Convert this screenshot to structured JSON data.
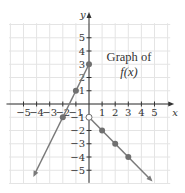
{
  "chart_data": {
    "type": "line",
    "title": "Graph of f(x)",
    "title_lines": [
      "Graph of",
      "f(x)"
    ],
    "xlabel": "x",
    "ylabel": "y",
    "xlim": [
      -5.8,
      6.2
    ],
    "ylim": [
      -6,
      6.8
    ],
    "x_ticks": [
      -5,
      -4,
      -3,
      -2,
      -1,
      1,
      2,
      3,
      4,
      5
    ],
    "x_tick_labels": [
      "−5",
      "−4",
      "−3",
      "−2",
      "−1",
      "1",
      "2",
      "3",
      "4",
      "5"
    ],
    "y_ticks": [
      5,
      4,
      3,
      2,
      1,
      -1,
      -2,
      -3,
      -4,
      -5
    ],
    "y_tick_labels": [
      "5",
      "4",
      "3",
      "2",
      "1",
      "−1",
      "−2",
      "−3",
      "−4",
      "−5"
    ],
    "grid": true,
    "legend": null,
    "series": [
      {
        "name": "f(x) for x ≤ 0",
        "equation": "y = 2x + 3",
        "segment": [
          [
            0,
            3
          ],
          [
            -4.25,
            -5.5
          ]
        ],
        "arrow_end": [
          -4.25,
          -5.5
        ],
        "points": [
          {
            "x": 0,
            "y": 3,
            "filled": true
          },
          {
            "x": -1,
            "y": 1,
            "filled": true
          },
          {
            "x": -2,
            "y": -1,
            "filled": true
          }
        ]
      },
      {
        "name": "f(x) for x > 0",
        "equation": "y = -x - 1",
        "segment": [
          [
            0,
            -1
          ],
          [
            4.85,
            -5.85
          ]
        ],
        "arrow_end": [
          4.85,
          -5.85
        ],
        "points": [
          {
            "x": 0,
            "y": -1,
            "filled": false
          },
          {
            "x": 1,
            "y": -2,
            "filled": true
          },
          {
            "x": 2,
            "y": -3,
            "filled": true
          },
          {
            "x": 3,
            "y": -4,
            "filled": true
          }
        ]
      }
    ],
    "colors": {
      "line": "#7a7a7a",
      "point": "#707070",
      "axis": "#333333",
      "grid": "#e4e4e4"
    }
  }
}
